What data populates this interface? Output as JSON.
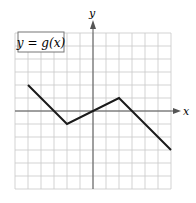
{
  "chart_data": {
    "type": "line",
    "title": "y = g(x)",
    "xlabel": "x",
    "ylabel": "y",
    "xlim": [
      -6,
      6
    ],
    "ylim": [
      -6,
      6
    ],
    "grid": true,
    "grid_step": 1,
    "tick_labels": false,
    "series": [
      {
        "name": "g(x)",
        "points": [
          [
            -5,
            2
          ],
          [
            -2,
            -1
          ],
          [
            2,
            1
          ],
          [
            6,
            -3
          ]
        ]
      }
    ]
  },
  "labels": {
    "function": "y = g(x)",
    "x_axis": "x",
    "y_axis": "y"
  },
  "colors": {
    "grid": "#c8c8c8",
    "axis": "#555555",
    "line": "#1a1a1a",
    "box_border": "#777777"
  }
}
